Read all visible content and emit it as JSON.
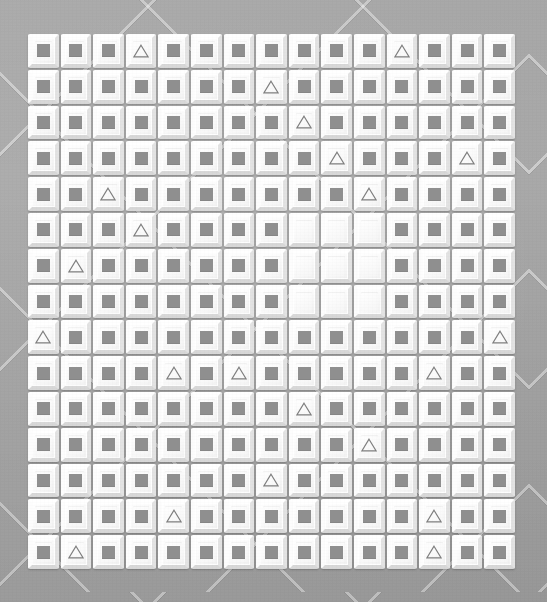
{
  "scene": {
    "title": "Tile Grid Puzzle Board",
    "background_color": "#a8a8a8",
    "background_pattern": "diagonal-diamond-floor",
    "tile_face_color": "#f7f7f7",
    "tile_highlight_color": "#ffffff",
    "tile_shadow_color": "#d8d8d8",
    "glyph_color": "#8f8f8f",
    "triangle_stroke_color": "#7e7e7e"
  },
  "grid": {
    "columns": 15,
    "rows": 15,
    "total_tiles": 225,
    "tile_size_px": 32.6,
    "origin_x_px": 27,
    "origin_y_px": 33,
    "width_px": 489,
    "height_px": 537
  },
  "legend": {
    "square_label": "square",
    "triangle_label": "triangle",
    "empty_label": "empty"
  },
  "counts": {
    "squares": 207,
    "triangles": 18,
    "empties": 9
  },
  "empty_block": {
    "rows": [
      6,
      7,
      8
    ],
    "columns": [
      9,
      10,
      11
    ],
    "size": "3x3"
  },
  "triangle_positions": [
    {
      "row": 1,
      "col": 4
    },
    {
      "row": 1,
      "col": 12
    },
    {
      "row": 2,
      "col": 8
    },
    {
      "row": 3,
      "col": 9
    },
    {
      "row": 4,
      "col": 10
    },
    {
      "row": 4,
      "col": 14
    },
    {
      "row": 5,
      "col": 3
    },
    {
      "row": 5,
      "col": 11
    },
    {
      "row": 6,
      "col": 4
    },
    {
      "row": 7,
      "col": 2
    },
    {
      "row": 9,
      "col": 1
    },
    {
      "row": 9,
      "col": 15
    },
    {
      "row": 10,
      "col": 5
    },
    {
      "row": 10,
      "col": 7
    },
    {
      "row": 10,
      "col": 13
    },
    {
      "row": 11,
      "col": 9
    },
    {
      "row": 12,
      "col": 11
    },
    {
      "row": 13,
      "col": 8
    },
    {
      "row": 14,
      "col": 5
    },
    {
      "row": 14,
      "col": 13
    },
    {
      "row": 15,
      "col": 2
    },
    {
      "row": 15,
      "col": 13
    }
  ],
  "cells": [
    [
      "square",
      "square",
      "square",
      "triangle",
      "square",
      "square",
      "square",
      "square",
      "square",
      "square",
      "square",
      "triangle",
      "square",
      "square",
      "square"
    ],
    [
      "square",
      "square",
      "square",
      "square",
      "square",
      "square",
      "square",
      "triangle",
      "square",
      "square",
      "square",
      "square",
      "square",
      "square",
      "square"
    ],
    [
      "square",
      "square",
      "square",
      "square",
      "square",
      "square",
      "square",
      "square",
      "triangle",
      "square",
      "square",
      "square",
      "square",
      "square",
      "square"
    ],
    [
      "square",
      "square",
      "square",
      "square",
      "square",
      "square",
      "square",
      "square",
      "square",
      "triangle",
      "square",
      "square",
      "square",
      "triangle",
      "square"
    ],
    [
      "square",
      "square",
      "triangle",
      "square",
      "square",
      "square",
      "square",
      "square",
      "square",
      "square",
      "triangle",
      "square",
      "square",
      "square",
      "square"
    ],
    [
      "square",
      "square",
      "square",
      "triangle",
      "square",
      "square",
      "square",
      "square",
      "empty",
      "empty",
      "empty",
      "square",
      "square",
      "square",
      "square"
    ],
    [
      "square",
      "triangle",
      "square",
      "square",
      "square",
      "square",
      "square",
      "square",
      "empty",
      "empty",
      "empty",
      "square",
      "square",
      "square",
      "square"
    ],
    [
      "square",
      "square",
      "square",
      "square",
      "square",
      "square",
      "square",
      "square",
      "empty",
      "empty",
      "empty",
      "square",
      "square",
      "square",
      "square"
    ],
    [
      "triangle",
      "square",
      "square",
      "square",
      "square",
      "square",
      "square",
      "square",
      "square",
      "square",
      "square",
      "square",
      "square",
      "square",
      "triangle"
    ],
    [
      "square",
      "square",
      "square",
      "square",
      "triangle",
      "square",
      "triangle",
      "square",
      "square",
      "square",
      "square",
      "square",
      "triangle",
      "square",
      "square"
    ],
    [
      "square",
      "square",
      "square",
      "square",
      "square",
      "square",
      "square",
      "square",
      "triangle",
      "square",
      "square",
      "square",
      "square",
      "square",
      "square"
    ],
    [
      "square",
      "square",
      "square",
      "square",
      "square",
      "square",
      "square",
      "square",
      "square",
      "square",
      "triangle",
      "square",
      "square",
      "square",
      "square"
    ],
    [
      "square",
      "square",
      "square",
      "square",
      "square",
      "square",
      "square",
      "triangle",
      "square",
      "square",
      "square",
      "square",
      "square",
      "square",
      "square"
    ],
    [
      "square",
      "square",
      "square",
      "square",
      "triangle",
      "square",
      "square",
      "square",
      "square",
      "square",
      "square",
      "square",
      "triangle",
      "square",
      "square"
    ],
    [
      "square",
      "triangle",
      "square",
      "square",
      "square",
      "square",
      "square",
      "square",
      "square",
      "square",
      "square",
      "square",
      "triangle",
      "square",
      "square"
    ]
  ]
}
